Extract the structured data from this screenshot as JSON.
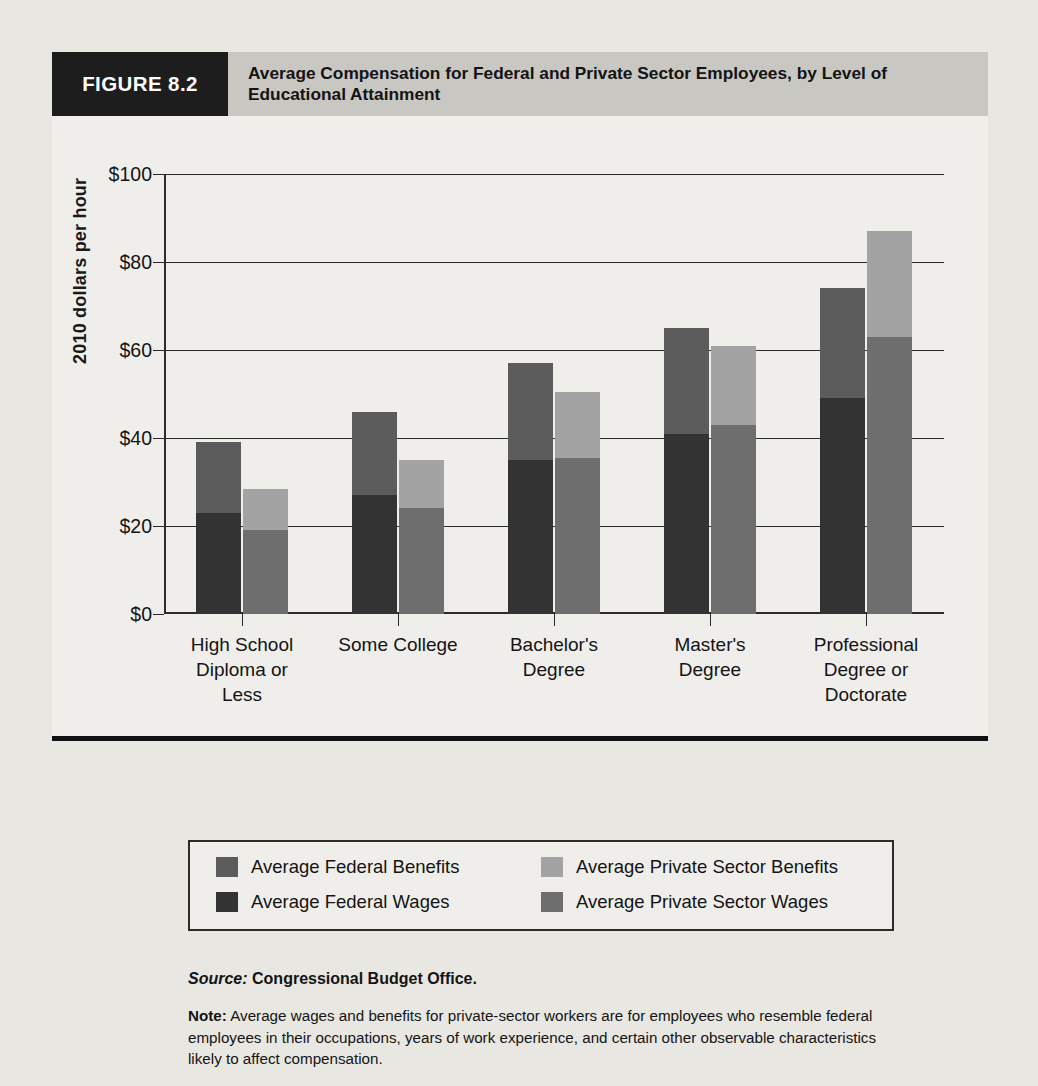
{
  "figure": {
    "tag": "FIGURE 8.2",
    "title": "Average Compensation  for Federal and Private Sector Employees, by Level of Educational Attainment"
  },
  "chart_data": {
    "type": "bar",
    "subtype": "grouped-stacked",
    "title": "Average Compensation  for Federal and Private Sector Employees, by Level of Educational Attainment",
    "xlabel": "",
    "ylabel": "2010 dollars per hour",
    "ylim": [
      0,
      100
    ],
    "yticks": [
      0,
      20,
      40,
      60,
      80,
      100
    ],
    "ytick_labels": [
      "$0",
      "$20",
      "$40",
      "$60",
      "$80",
      "$100"
    ],
    "grid": true,
    "legend_position": "below-plot",
    "categories": [
      "High School Diploma or Less",
      "Some College",
      "Bachelor's Degree",
      "Master's Degree",
      "Professional Degree or Doctorate"
    ],
    "category_lines": [
      [
        "High School",
        "Diploma or",
        "Less"
      ],
      [
        "Some College"
      ],
      [
        "Bachelor's",
        "Degree"
      ],
      [
        "Master's",
        "Degree"
      ],
      [
        "Professional",
        "Degree or",
        "Doctorate"
      ]
    ],
    "series": [
      {
        "name": "Average Federal Wages",
        "stack": "federal",
        "color": "#333333",
        "values": [
          23,
          27,
          35,
          41,
          49
        ]
      },
      {
        "name": "Average Federal Benefits",
        "stack": "federal",
        "color": "#5c5c5c",
        "values": [
          16,
          19,
          22,
          24,
          25
        ]
      },
      {
        "name": "Average Private Sector Wages",
        "stack": "private",
        "color": "#6e6e6e",
        "values": [
          19,
          24,
          35.5,
          43,
          63
        ]
      },
      {
        "name": "Average Private Sector Benefits",
        "stack": "private",
        "color": "#a3a3a3",
        "values": [
          9.5,
          11,
          15,
          18,
          24
        ]
      }
    ],
    "totals": {
      "federal": [
        39,
        46,
        57,
        65,
        74
      ],
      "private": [
        28.5,
        35,
        50.5,
        61,
        87
      ]
    }
  },
  "legend": [
    {
      "label": "Average Federal Benefits",
      "color": "#5c5c5c",
      "swatch": "federal-benefits-swatch"
    },
    {
      "label": "Average Private Sector Benefits",
      "color": "#a3a3a3",
      "swatch": "private-benefits-swatch"
    },
    {
      "label": "Average Federal Wages",
      "color": "#333333",
      "swatch": "federal-wages-swatch"
    },
    {
      "label": "Average Private Sector Wages",
      "color": "#6e6e6e",
      "swatch": "private-wages-swatch"
    }
  ],
  "footer": {
    "source_label": "Source:",
    "source_text": "Congressional Budget Office.",
    "note_label": "Note:",
    "note_text": "Average wages and benefits for private-sector workers are for employees who resemble federal employees in their occupations, years of work experience, and certain other observable characteristics likely to affect compensation."
  },
  "background_text": "knowledge, accepting, or serving that particular organization. The employees of the work the federal tasks were can have those problems of the specific setting (including expecta-tions of the pay for the work of the public, which is in the middle of the private sector pay scale), and these benefits all services to the subject. In the governing sector, the workers working in the public interest. It also set an opportunity, using rates, jobs for train-ing, compensation, and working conditions that the comparable study compares and is higher or lower than the private pay to the employees where to work."
}
